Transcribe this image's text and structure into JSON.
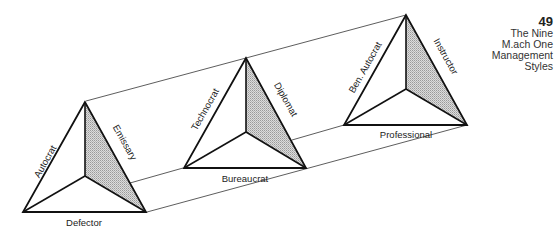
{
  "header": {
    "page_number": "49",
    "title_lines": [
      "The Nine",
      "M.ach One",
      "Management",
      "Styles"
    ]
  },
  "colors": {
    "stroke": "#111111",
    "connector": "#333333",
    "shaded_face": "#c9c9c9"
  },
  "pyramids": [
    {
      "id": "left",
      "left_edge_label": "Autocrat",
      "right_edge_label": "Emissary",
      "base_label": "Defector"
    },
    {
      "id": "middle",
      "left_edge_label": "Technocrat",
      "right_edge_label": "Diplomat",
      "base_label": "Bureaucrat"
    },
    {
      "id": "right",
      "left_edge_label": "Ben. Autocrat",
      "right_edge_label": "Instructor",
      "base_label": "Professional"
    }
  ]
}
